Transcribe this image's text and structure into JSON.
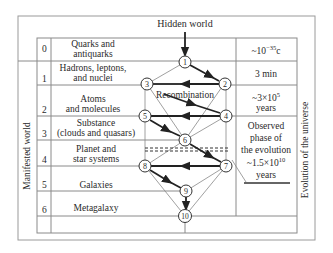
{
  "header": {
    "title": "Hidden world"
  },
  "left_label": "Manifested world",
  "right_label": "Evolution of the universe",
  "rows": [
    {
      "index": "0",
      "label_lines": [
        "Quarks and",
        "antiquarks"
      ]
    },
    {
      "index": "1",
      "label_lines": [
        "Hadrons, leptons,",
        "and nuclei"
      ]
    },
    {
      "index": "2",
      "label_lines": [
        "Atoms",
        "and molecules"
      ]
    },
    {
      "index": "3",
      "label_lines": [
        "Substance",
        "(clouds and quasars)"
      ]
    },
    {
      "index": "4",
      "label_lines": [
        "Planet and",
        "star systems"
      ]
    },
    {
      "index": "5",
      "label_lines": [
        "Galaxies"
      ]
    },
    {
      "index": "6",
      "label_lines": [
        "Metagalaxy"
      ]
    }
  ],
  "time_column": {
    "row0": {
      "prefix": "~10",
      "exp": "−35",
      "suffix": "c"
    },
    "row1": "3 min",
    "row2": {
      "prefix": "~3×10",
      "exp": "5",
      "line2": "years"
    },
    "observed": {
      "lines": [
        "Observed",
        "phase of",
        "the evolution"
      ],
      "value_prefix": "~1.5×10",
      "value_exp": "10",
      "unit": "years"
    }
  },
  "nodes": [
    "1",
    "2",
    "3",
    "4",
    "5",
    "6",
    "7",
    "8",
    "9",
    "10"
  ],
  "annotation": "Recombination"
}
